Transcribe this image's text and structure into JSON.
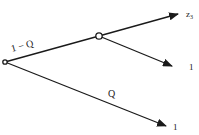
{
  "diagram": {
    "type": "probability-tree",
    "nodes": {
      "root": {
        "x": 5,
        "y": 62
      },
      "middle": {
        "x": 99,
        "y": 36
      }
    },
    "edges": [
      {
        "from": "root",
        "to": "middle",
        "label": "1 − Q"
      },
      {
        "from": "middle",
        "to": "leaf_top",
        "label": ""
      },
      {
        "from": "middle",
        "to": "leaf_mid",
        "label": ""
      },
      {
        "from": "root",
        "to": "leaf_bottom",
        "label": "Q"
      }
    ],
    "leaves": {
      "leaf_top": {
        "label": "z",
        "subscript": "3"
      },
      "leaf_mid": {
        "label": "1"
      },
      "leaf_bottom": {
        "label": "1"
      }
    },
    "colors": {
      "line": "#1a1a1a",
      "background": "#ffffff"
    }
  }
}
